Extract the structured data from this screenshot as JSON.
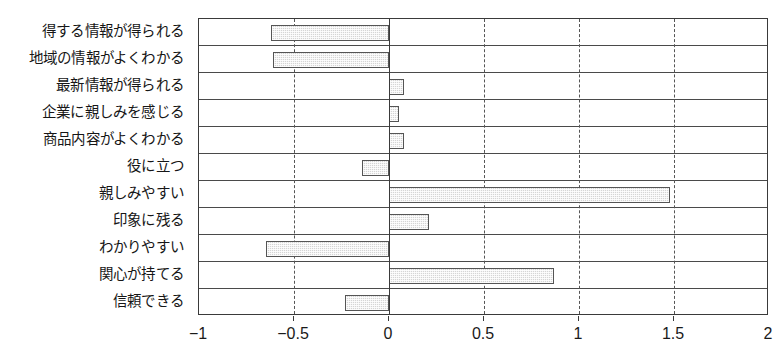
{
  "chart_data": {
    "type": "bar",
    "orientation": "horizontal",
    "title": "",
    "subtitle": "",
    "xlabel": "",
    "ylabel": "",
    "xlim": [
      -1,
      2
    ],
    "ylim": null,
    "grid": true,
    "legend": null,
    "legend_position": "none",
    "annotations": [],
    "xticks": [
      -1,
      -0.5,
      0,
      0.5,
      1,
      1.5,
      2
    ],
    "xtick_labels": [
      "−1",
      "−0.5",
      "0",
      "0.5",
      "1",
      "1.5",
      "2"
    ],
    "zero_line": 0,
    "categories": [
      "得する情報が得られる",
      "地域の情報がよくわかる",
      "最新情報が得られる",
      "企業に親しみを感じる",
      "商品内容がよくわかる",
      "役に立つ",
      "親しみやすい",
      "印象に残る",
      "わかりやすい",
      "関心が持てる",
      "信頼できる"
    ],
    "values": [
      -0.62,
      -0.61,
      0.08,
      0.05,
      0.08,
      -0.14,
      1.48,
      0.21,
      -0.65,
      0.87,
      -0.23
    ],
    "series": [
      {
        "name": "",
        "values": [
          -0.62,
          -0.61,
          0.08,
          0.05,
          0.08,
          -0.14,
          1.48,
          0.21,
          -0.65,
          0.87,
          -0.23
        ]
      }
    ],
    "colors": {
      "bar_fill": "#d5d5d5",
      "bar_border": "#555555",
      "axis": "#3a3a3a",
      "gridline": "#4a4a4a",
      "vgridline": "#555555",
      "text": "#1a1a1a",
      "background": "#ffffff"
    }
  }
}
